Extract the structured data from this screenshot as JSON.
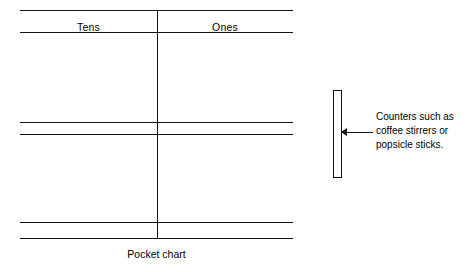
{
  "figure": {
    "caption": "Pocket chart",
    "chart": {
      "columns": [
        {
          "label": "Tens"
        },
        {
          "label": "Ones"
        }
      ],
      "pocket_lines": [
        {
          "name": "header-top",
          "y": 10
        },
        {
          "name": "header-bottom",
          "y": 32
        },
        {
          "name": "pocket-1-bottom",
          "y": 122
        },
        {
          "name": "pocket-2-top",
          "y": 134
        },
        {
          "name": "pocket-2-bottom",
          "y": 222
        },
        {
          "name": "pocket-3-top",
          "y": 238
        }
      ],
      "divider": {
        "name": "column-divider",
        "x": 137
      }
    },
    "annotation": {
      "lines": [
        "Counters such as",
        "coffee stirrers or",
        "popsicle sticks."
      ],
      "line1": "Counters such as",
      "line2": "coffee stirrers or",
      "line3": "popsicle sticks.",
      "target": "counter-stick",
      "arrow_direction": "left"
    },
    "colors": {
      "ink": "#111111",
      "background": "#ffffff"
    }
  }
}
